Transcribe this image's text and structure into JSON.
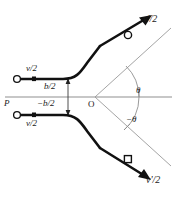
{
  "figure": {
    "type": "physics-scattering-diagram",
    "background_color": "#ffffff",
    "stroke_color": "#111111",
    "thin_stroke_color": "#8a8a8a",
    "width": 175,
    "height": 197
  },
  "labels": {
    "axis_origin_left": "P",
    "axis_origin_center": "O",
    "speed_in_upper": "v/2",
    "speed_in_lower": "v/2",
    "speed_out_upper": "v'/2",
    "speed_out_lower": "v'/2",
    "impact_upper": "b/2",
    "impact_lower": "−b/2",
    "angle_upper": "θ",
    "angle_lower": "−θ"
  },
  "geometry": {
    "origin_x": 95,
    "origin_y": 97,
    "axis_y": 97,
    "axis_x_start": 5,
    "axis_x_end": 172,
    "impact_offset_upper": -18,
    "impact_offset_lower": 18,
    "scatter_angle_deg": 42,
    "incoming_start_x": 17,
    "incoming_end_x": 62
  },
  "markers": {
    "incoming_upper_circle": {
      "x": 17,
      "y": 79,
      "shape": "open-circle"
    },
    "incoming_lower_circle": {
      "x": 17,
      "y": 115,
      "shape": "open-circle"
    },
    "incoming_upper_dot": {
      "x": 34,
      "y": 79,
      "shape": "filled-square"
    },
    "incoming_lower_dot": {
      "x": 34,
      "y": 115,
      "shape": "filled-square"
    },
    "outgoing_upper_circle": {
      "x": 129,
      "y": 35,
      "shape": "open-circle"
    },
    "outgoing_lower_circle": {
      "x": 128,
      "y": 160,
      "shape": "open-square"
    }
  }
}
